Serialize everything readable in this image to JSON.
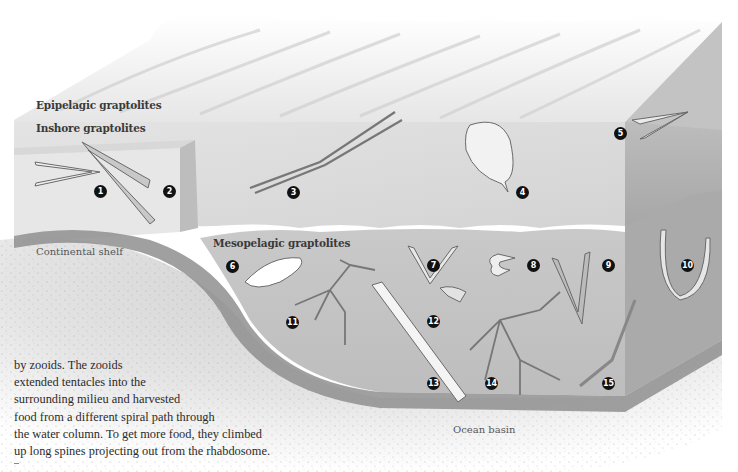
{
  "figure": {
    "zones": {
      "epipelagic": "Epipelagic graptolites",
      "inshore": "Inshore graptolites",
      "mesopelagic": "Mesopelagic graptolites"
    },
    "regions": {
      "continental_shelf": "Continental shelf",
      "ocean_basin": "Ocean basin"
    },
    "specimens": [
      {
        "number": "1",
        "glyph": "❶",
        "zone": "inshore",
        "form": "two-branched serrated"
      },
      {
        "number": "2",
        "glyph": "❷",
        "zone": "inshore",
        "form": "v-shaped biserial"
      },
      {
        "number": "3",
        "glyph": "❸",
        "zone": "epipelagic",
        "form": "long two-stipe"
      },
      {
        "number": "4",
        "glyph": "❹",
        "zone": "epipelagic",
        "form": "leaf-shaped"
      },
      {
        "number": "5",
        "glyph": "❺",
        "zone": "epipelagic",
        "form": "small v-shaped"
      },
      {
        "number": "6",
        "glyph": "❻",
        "zone": "mesopelagic",
        "form": "spiny oval"
      },
      {
        "number": "7",
        "glyph": "❼",
        "zone": "mesopelagic",
        "form": "v-shaped serrated"
      },
      {
        "number": "8",
        "glyph": "❽",
        "zone": "mesopelagic",
        "form": "curled"
      },
      {
        "number": "9",
        "glyph": "❾",
        "zone": "mesopelagic",
        "form": "broad v-shaped"
      },
      {
        "number": "10",
        "glyph": "❿",
        "zone": "mesopelagic",
        "form": "u-shaped"
      },
      {
        "number": "11",
        "glyph": "⓫",
        "zone": "mesopelagic",
        "form": "branching"
      },
      {
        "number": "12",
        "glyph": "⓬",
        "zone": "mesopelagic",
        "form": "small fan"
      },
      {
        "number": "13",
        "glyph": "⓭",
        "zone": "mesopelagic",
        "form": "long biserial"
      },
      {
        "number": "14",
        "glyph": "⓮",
        "zone": "mesopelagic",
        "form": "dendroid branching"
      },
      {
        "number": "15",
        "glyph": "⓯",
        "zone": "mesopelagic",
        "form": "thin spiral"
      }
    ]
  },
  "caption": {
    "lines": [
      "by zooids. The zooids",
      "extended tentacles into the",
      "surrounding milieu and harvested",
      "food from a different spiral path through",
      "the water column. To get more food, they climbed",
      "up long spines projecting out from the rhabdosome."
    ]
  },
  "colors": {
    "sea_surface": "#f2f2f2",
    "water_light": "#dadada",
    "water_mid": "#c4c4c4",
    "water_dark": "#a9a9a9",
    "sediment": "#d9d9d9",
    "sediment_band": "#8e8e8e"
  }
}
